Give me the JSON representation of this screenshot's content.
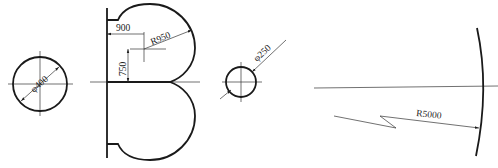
{
  "diagram": {
    "type": "technical-drawing",
    "figures": [
      {
        "id": "circle-400",
        "label": "φ400",
        "kind": "diameter"
      },
      {
        "id": "lobe-shape",
        "labels": [
          "900",
          "R950",
          "750"
        ],
        "kind": "double-lobe-profile"
      },
      {
        "id": "circle-250",
        "label": "φ250",
        "kind": "diameter"
      },
      {
        "id": "arc-5000",
        "label": "R5000",
        "kind": "large-radius-arc"
      }
    ]
  },
  "labels": {
    "d400": "φ400",
    "dim900": "900",
    "r950": "R950",
    "dim750": "750",
    "d250": "φ250",
    "r5000": "R5000"
  },
  "colors": {
    "line": "#1a1a1a",
    "background": "#ffffff"
  }
}
